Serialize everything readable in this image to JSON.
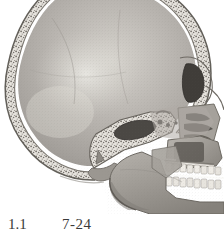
{
  "figure": {
    "orientation": "lateral, facing right",
    "rendering": "halftone grayscale anatomical engraving",
    "background_color": "#ffffff",
    "palette": {
      "paper": "#ffffff",
      "cranium_interior_light": "#c9c6c1",
      "cranium_interior_mid": "#a9a6a1",
      "cranium_interior_dark": "#8d8a86",
      "diploe_light": "#e3e0da",
      "diploe_speckle": "#6e6a66",
      "cortical_outline": "#6a6761",
      "face_mid": "#b2aea8",
      "face_dark": "#8a8680",
      "sinus_cavity": "#45423e",
      "tooth_enamel": "#efece6",
      "occlusal_line": "#fbfbf9"
    },
    "structures": [
      {
        "name": "calvaria",
        "label": "Calvaria (cranial vault)"
      },
      {
        "name": "diploe",
        "label": "Diploe of vault"
      },
      {
        "name": "cranial-cavity",
        "label": "Cranial cavity"
      },
      {
        "name": "frontal-sinus",
        "label": "Frontal sinus"
      },
      {
        "name": "sphenoid-sinus",
        "label": "Sphenoidal sinus"
      },
      {
        "name": "sella-turcica",
        "label": "Sella turcica"
      },
      {
        "name": "occipital-bone",
        "label": "Occipital bone"
      },
      {
        "name": "nasal-cavity",
        "label": "Nasal cavity"
      },
      {
        "name": "nasal-conchae",
        "label": "Nasal conchae"
      },
      {
        "name": "maxilla",
        "label": "Maxilla"
      },
      {
        "name": "maxillary-teeth",
        "label": "Upper dental arch"
      },
      {
        "name": "mandible",
        "label": "Mandible"
      },
      {
        "name": "mandibular-teeth",
        "label": "Lower dental arch"
      },
      {
        "name": "occlusal-plane-line",
        "label": "Occlusal plane"
      },
      {
        "name": "hard-palate",
        "label": "Hard palate"
      },
      {
        "name": "mental-protuberance",
        "label": "Mental protuberance"
      }
    ]
  },
  "caption": {
    "left_fragment": "1.1",
    "right_fragment": "7-24",
    "note": "caption clipped by lower page edge"
  }
}
